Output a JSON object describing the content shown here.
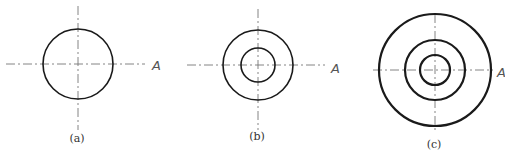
{
  "figures": [
    {
      "id": "a",
      "caption": "(a)",
      "axis_label": "A",
      "cx": 78,
      "cy": 64,
      "radii": [
        35
      ],
      "stroke": [
        1.6
      ],
      "vline": [
        6,
        130
      ],
      "hline": [
        6,
        145
      ],
      "label_pos": [
        152,
        70
      ],
      "cap_pos": [
        77,
        142
      ]
    },
    {
      "id": "b",
      "caption": "(b)",
      "axis_label": "A",
      "cx": 258,
      "cy": 65,
      "radii": [
        35,
        17
      ],
      "stroke": [
        1.6,
        1.6
      ],
      "vline": [
        9,
        130
      ],
      "hline": [
        187,
        325
      ],
      "label_pos": [
        331,
        73
      ],
      "cap_pos": [
        257,
        140
      ]
    },
    {
      "id": "c",
      "caption": "(c)",
      "axis_label": "A",
      "cx": 435,
      "cy": 70,
      "radii": [
        56,
        30,
        15
      ],
      "stroke": [
        2.2,
        2.2,
        2.2
      ],
      "vline": [
        14,
        133
      ],
      "hline": [
        373,
        493
      ],
      "label_pos": [
        497,
        77
      ],
      "cap_pos": [
        434,
        148
      ]
    }
  ],
  "colors": {
    "line": "#1a1a1a",
    "centerline": "#777777"
  }
}
